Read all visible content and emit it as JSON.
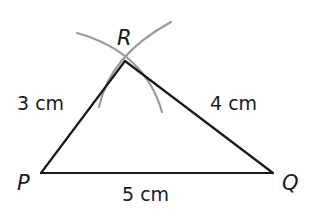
{
  "diagram": {
    "type": "triangle-construction",
    "colors": {
      "stroke": "#1a1a1a",
      "arc": "#9a9a9a",
      "background": "#ffffff"
    },
    "vertices": {
      "P": {
        "label": "P",
        "x": 41,
        "y": 173
      },
      "Q": {
        "label": "Q",
        "x": 273,
        "y": 173
      },
      "R": {
        "label": "R",
        "x": 125,
        "y": 61
      }
    },
    "sides": {
      "PR": {
        "label": "3 cm"
      },
      "RQ": {
        "label": "4 cm"
      },
      "PQ": {
        "label": "5 cm"
      }
    },
    "arcs": [
      {
        "name": "arc-centered-P",
        "radius_label": "3 cm"
      },
      {
        "name": "arc-centered-Q",
        "radius_label": "4 cm"
      }
    ]
  }
}
